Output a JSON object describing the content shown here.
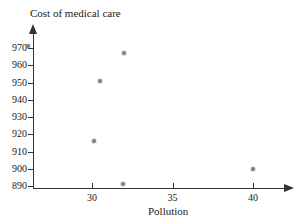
{
  "chart_data": {
    "type": "scatter",
    "title": "Cost of medical care",
    "xlabel": "Pollution",
    "ylabel": "Cost of medical care",
    "grid": false,
    "legend": false,
    "xlim": [
      25.5,
      41.5
    ],
    "ylim": [
      886,
      974
    ],
    "xticks": [
      30,
      35,
      40
    ],
    "xtick_labels": [
      "30",
      "35",
      "40"
    ],
    "yticks": [
      890,
      900,
      910,
      920,
      930,
      940,
      950,
      960,
      970
    ],
    "ytick_labels": [
      "890",
      "900",
      "910",
      "920",
      "930",
      "940",
      "950",
      "960",
      "970"
    ],
    "points": [
      {
        "x": 26.0,
        "y": 971
      },
      {
        "x": 30.1,
        "y": 916
      },
      {
        "x": 30.5,
        "y": 951
      },
      {
        "x": 31.9,
        "y": 891
      },
      {
        "x": 32.0,
        "y": 967
      },
      {
        "x": 40.0,
        "y": 900
      }
    ]
  },
  "axes": {
    "y_axis_name": "cost-axis",
    "x_axis_name": "pollution-axis"
  }
}
